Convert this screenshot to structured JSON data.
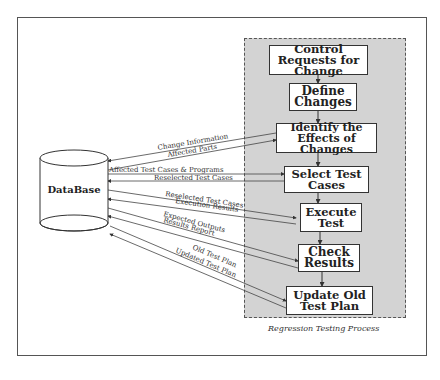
{
  "diagram": {
    "database_label": "DataBase",
    "process_caption": "Regression Testing Process",
    "steps": [
      {
        "id": "control",
        "label": "Control Requests for Change"
      },
      {
        "id": "define",
        "label": "Define Changes"
      },
      {
        "id": "identify",
        "label": "Identify the Effects of Changes"
      },
      {
        "id": "select",
        "label": "Select Test Cases"
      },
      {
        "id": "execute",
        "label": "Execute Test"
      },
      {
        "id": "check",
        "label": "Check Results"
      },
      {
        "id": "update",
        "label": "Update Old Test Plan"
      }
    ],
    "flows": [
      {
        "label": "Change Information",
        "from": "identify",
        "to": "database"
      },
      {
        "label": "Affected Parts",
        "from": "database",
        "to": "identify"
      },
      {
        "label": "Affected Test Cases & Programs",
        "from": "database",
        "to": "select"
      },
      {
        "label": "Reselected Test Cases",
        "from": "select",
        "to": "database"
      },
      {
        "label": "Reselected Test Cases",
        "from": "database",
        "to": "execute"
      },
      {
        "label": "Execution Results",
        "from": "execute",
        "to": "database"
      },
      {
        "label": "Expected Outputs",
        "from": "database",
        "to": "check"
      },
      {
        "label": "Results Report",
        "from": "check",
        "to": "database"
      },
      {
        "label": "Old Test Plan",
        "from": "database",
        "to": "update"
      },
      {
        "label": "Updated Test Plan",
        "from": "update",
        "to": "database"
      }
    ]
  }
}
